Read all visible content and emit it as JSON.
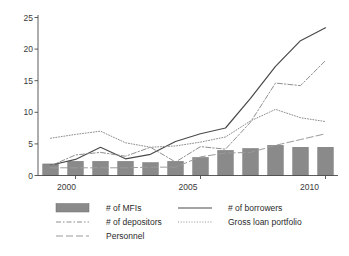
{
  "chart_data": {
    "type": "line",
    "title": "",
    "subtitle": "",
    "xlabel": "",
    "ylabel": "",
    "x": [
      1999,
      2000,
      2001,
      2002,
      2003,
      2004,
      2005,
      2006,
      2007,
      2008,
      2009,
      2010
    ],
    "xlim": [
      1998.5,
      2010.5
    ],
    "ylim": [
      0,
      25
    ],
    "yticks": [
      0,
      5,
      10,
      15,
      20,
      25
    ],
    "ytick_labels": [
      "0",
      "5",
      "10",
      "15",
      "20",
      "25"
    ],
    "xticks": [
      2000,
      2005,
      2010
    ],
    "xtick_labels": [
      "2000",
      "2005",
      "2010"
    ],
    "grid": false,
    "legend_position": "below",
    "series": [
      {
        "name": "# of MFIs",
        "style": "bar",
        "color": "#8a8a8a",
        "values": [
          1.8,
          2.2,
          2.2,
          2.2,
          2.0,
          2.2,
          2.8,
          3.9,
          4.2,
          4.7,
          4.4,
          4.4
        ]
      },
      {
        "name": "# of borrowers",
        "style": "solid",
        "color": "#4a4a4a",
        "values": [
          1.6,
          2.5,
          4.4,
          2.6,
          3.3,
          5.3,
          6.5,
          7.4,
          12.0,
          17.0,
          21.0,
          23.0
        ]
      },
      {
        "name": "# of depositors",
        "style": "dashdot",
        "color": "#8f8f8f",
        "values": [
          1.5,
          3.2,
          3.6,
          3.0,
          4.4,
          2.1,
          4.5,
          4.1,
          8.3,
          14.4,
          14.0,
          17.9
        ]
      },
      {
        "name": "Gross loan portfolio",
        "style": "dotted",
        "color": "#8f8f8f",
        "values": [
          5.8,
          6.4,
          6.9,
          5.1,
          4.4,
          4.6,
          5.2,
          6.0,
          8.5,
          10.3,
          9.0,
          8.4
        ]
      },
      {
        "name": "Personnel",
        "style": "longdash",
        "color": "#9a9a9a",
        "values": [
          1.2,
          1.2,
          1.2,
          1.2,
          1.3,
          1.3,
          2.9,
          3.5,
          3.6,
          4.7,
          5.6,
          6.5
        ]
      }
    ]
  },
  "legend": {
    "items": [
      {
        "label": "# of MFIs",
        "swatch": "bar-swatch"
      },
      {
        "label": "# of borrowers",
        "swatch": "solid-line-swatch"
      },
      {
        "label": "# of depositors",
        "swatch": "dashdot-line-swatch"
      },
      {
        "label": "Gross loan portfolio",
        "swatch": "dotted-line-swatch"
      },
      {
        "label": "Personnel",
        "swatch": "longdash-line-swatch"
      }
    ]
  },
  "axis": {
    "y_labels": [
      "25",
      "20",
      "15",
      "10",
      "5",
      "0"
    ],
    "x_labels": [
      "2000",
      "2005",
      "2010"
    ]
  }
}
